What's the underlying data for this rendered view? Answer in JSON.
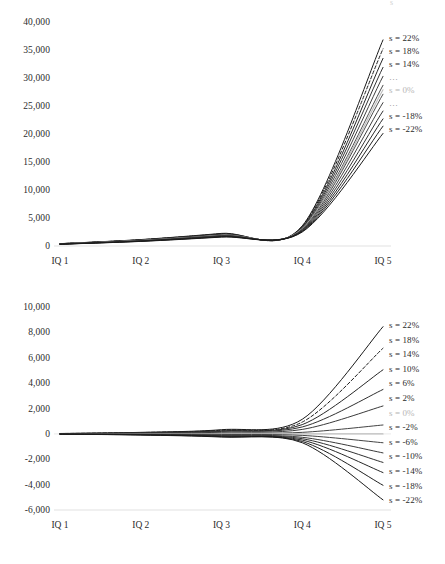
{
  "chart_data": [
    {
      "id": "top",
      "type": "line",
      "title": "",
      "xlabel": "",
      "ylabel": "",
      "x": [
        "IQ 1",
        "IQ 2",
        "IQ 3",
        "IQ 4",
        "IQ 5"
      ],
      "xticklabels": [
        "IQ 1",
        "IQ 2",
        "IQ 3",
        "IQ 4",
        "IQ 5"
      ],
      "yticklabels": [
        "40,000",
        "35,000",
        "30,000",
        "25,000",
        "20,000",
        "15,000",
        "10,000",
        "5,000",
        "0"
      ],
      "ytickvalues": [
        40000,
        35000,
        30000,
        25000,
        20000,
        15000,
        10000,
        5000,
        0
      ],
      "ylim": [
        0,
        40000
      ],
      "grid": false,
      "legend_position": "right-inside",
      "series": [
        {
          "name": "s = 22%",
          "style": "solid",
          "color": "#1a1a1a",
          "values": [
            420,
            1150,
            2250,
            3600,
            36800
          ]
        },
        {
          "name": "s = 18%",
          "style": "dashed",
          "color": "#1a1a1a",
          "values": [
            410,
            1120,
            2190,
            3500,
            35200
          ]
        },
        {
          "name": "s = 14%",
          "style": "solid",
          "color": "#262626",
          "values": [
            400,
            1090,
            2130,
            3400,
            33500
          ]
        },
        {
          "name": "s = 10%",
          "style": "solid",
          "color": "#333333",
          "values": [
            390,
            1060,
            2070,
            3300,
            31900
          ]
        },
        {
          "name": "s = 6%",
          "style": "solid",
          "color": "#3f3f3f",
          "values": [
            380,
            1030,
            2010,
            3200,
            30300
          ]
        },
        {
          "name": "s = 2%",
          "style": "solid",
          "color": "#4c4c4c",
          "values": [
            370,
            1000,
            1950,
            3100,
            28700
          ]
        },
        {
          "name": "s = 0%",
          "style": "solid",
          "color": "#bdbdbd",
          "values": [
            365,
            985,
            1920,
            3050,
            27900
          ]
        },
        {
          "name": "s = -2%",
          "style": "solid",
          "color": "#4c4c4c",
          "values": [
            360,
            970,
            1890,
            3000,
            27100
          ]
        },
        {
          "name": "s = -6%",
          "style": "solid",
          "color": "#3f3f3f",
          "values": [
            350,
            940,
            1830,
            2900,
            25600
          ]
        },
        {
          "name": "s = -10%",
          "style": "solid",
          "color": "#333333",
          "values": [
            340,
            910,
            1770,
            2800,
            24100
          ]
        },
        {
          "name": "s = -14%",
          "style": "solid",
          "color": "#262626",
          "values": [
            330,
            880,
            1710,
            2700,
            22700
          ]
        },
        {
          "name": "s = -18%",
          "style": "solid",
          "color": "#1f1f1f",
          "values": [
            320,
            850,
            1650,
            2600,
            21400
          ]
        },
        {
          "name": "s = -22%",
          "style": "solid",
          "color": "#1a1a1a",
          "values": [
            310,
            820,
            1590,
            2500,
            20100
          ]
        }
      ],
      "legend_labels": [
        {
          "text": "s = 22%",
          "style": "normal"
        },
        {
          "text": "s = 18%",
          "style": "normal"
        },
        {
          "text": "s = 14%",
          "style": "normal"
        },
        {
          "text": "…",
          "style": "dots"
        },
        {
          "text": "s = 0%",
          "style": "faint"
        },
        {
          "text": "…",
          "style": "dots"
        },
        {
          "text": "s = -18%",
          "style": "normal"
        },
        {
          "text": "s = -22%",
          "style": "normal"
        }
      ]
    },
    {
      "id": "bottom",
      "type": "line",
      "title": "",
      "xlabel": "",
      "ylabel": "",
      "x": [
        "IQ 1",
        "IQ 2",
        "IQ 3",
        "IQ 4",
        "IQ 5"
      ],
      "xticklabels": [
        "IQ 1",
        "IQ 2",
        "IQ 3",
        "IQ 4",
        "IQ 5"
      ],
      "yticklabels": [
        "10,000",
        "8,000",
        "6,000",
        "4,000",
        "2,000",
        "0",
        "-2,000",
        "-4,000",
        "-6,000"
      ],
      "ytickvalues": [
        10000,
        8000,
        6000,
        4000,
        2000,
        0,
        -2000,
        -4000,
        -6000
      ],
      "ylim": [
        -6000,
        10000
      ],
      "grid": false,
      "legend_position": "right-inside",
      "series": [
        {
          "name": "s = 22%",
          "style": "solid",
          "color": "#1a1a1a",
          "values": [
            30,
            120,
            330,
            1150,
            8450
          ]
        },
        {
          "name": "s = 18%",
          "style": "dashed",
          "color": "#1a1a1a",
          "values": [
            26,
            104,
            286,
            930,
            6750
          ]
        },
        {
          "name": "s = 14%",
          "style": "solid",
          "color": "#262626",
          "values": [
            22,
            88,
            242,
            730,
            5050
          ]
        },
        {
          "name": "s = 10%",
          "style": "solid",
          "color": "#303030",
          "values": [
            17,
            70,
            194,
            545,
            3500
          ]
        },
        {
          "name": "s = 6%",
          "style": "solid",
          "color": "#3a3a3a",
          "values": [
            11,
            46,
            128,
            350,
            2200
          ]
        },
        {
          "name": "s = 2%",
          "style": "solid",
          "color": "#444444",
          "values": [
            4,
            16,
            44,
            120,
            700
          ]
        },
        {
          "name": "s = 0%",
          "style": "solid",
          "color": "#bdbdbd",
          "values": [
            0,
            0,
            0,
            0,
            0
          ]
        },
        {
          "name": "s = -2%",
          "style": "solid",
          "color": "#444444",
          "values": [
            -4,
            -16,
            -44,
            -120,
            -700
          ]
        },
        {
          "name": "s = -6%",
          "style": "solid",
          "color": "#3a3a3a",
          "values": [
            -9,
            -36,
            -100,
            -270,
            -1500
          ]
        },
        {
          "name": "s = -10%",
          "style": "solid",
          "color": "#303030",
          "values": [
            -13,
            -52,
            -142,
            -380,
            -2250
          ]
        },
        {
          "name": "s = -14%",
          "style": "solid",
          "color": "#262626",
          "values": [
            -17,
            -66,
            -182,
            -490,
            -3050
          ]
        },
        {
          "name": "s = -18%",
          "style": "solid",
          "color": "#1f1f1f",
          "values": [
            -20,
            -80,
            -218,
            -600,
            -4050
          ]
        },
        {
          "name": "s = -22%",
          "style": "solid",
          "color": "#1a1a1a",
          "values": [
            -23,
            -92,
            -252,
            -700,
            -5200
          ]
        }
      ],
      "legend_labels": [
        {
          "text": "s = 22%",
          "style": "normal"
        },
        {
          "text": "s = 18%",
          "style": "normal"
        },
        {
          "text": "s = 14%",
          "style": "normal"
        },
        {
          "text": "s = 10%",
          "style": "normal"
        },
        {
          "text": "s = 6%",
          "style": "normal"
        },
        {
          "text": "s = 2%",
          "style": "normal"
        },
        {
          "text": "s = 0%",
          "style": "faint"
        },
        {
          "text": "s = -2%",
          "style": "normal"
        },
        {
          "text": "s = -6%",
          "style": "normal"
        },
        {
          "text": "s = -10%",
          "style": "normal"
        },
        {
          "text": "s = -14%",
          "style": "normal"
        },
        {
          "text": "s = -18%",
          "style": "normal"
        },
        {
          "text": "s = -22%",
          "style": "normal"
        }
      ]
    }
  ],
  "colors": {
    "axis": "#d9d9d9",
    "text": "#2b2b2b",
    "line_dark": "#1a1a1a",
    "line_zero": "#bdbdbd",
    "background": "#ffffff"
  }
}
